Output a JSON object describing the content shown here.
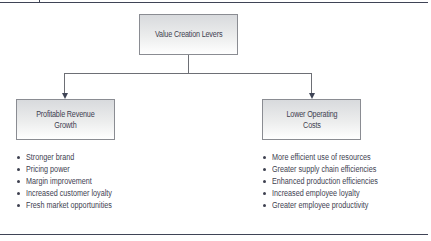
{
  "diagram": {
    "root": {
      "label": "Value Creation Levers"
    },
    "branches": [
      {
        "label_lines": [
          "Profitable Revenue",
          "Growth"
        ],
        "items": [
          "Stronger brand",
          "Pricing power",
          "Margin improvement",
          "Increased customer loyalty",
          "Fresh market opportunities"
        ]
      },
      {
        "label_lines": [
          "Lower Operating",
          "Costs"
        ],
        "items": [
          "More efficient use of resources",
          "Greater supply chain efficiencies",
          "Enhanced production efficiencies",
          "Increased employee loyalty",
          "Greater employee productivity"
        ]
      }
    ]
  }
}
